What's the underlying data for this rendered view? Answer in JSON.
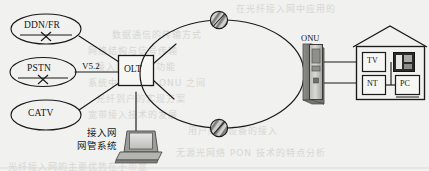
{
  "figure": {
    "type": "network-topology-diagram"
  },
  "background_color": "#f1f1ef",
  "line_color": "#1a1a1a",
  "sources": [
    {
      "id": "ddn-fr",
      "label": "DDN/FR",
      "shape": "ellipse",
      "has_cross_symbol": true
    },
    {
      "id": "pstn",
      "label": "PSTN",
      "shape": "ellipse",
      "has_cross_symbol": true
    },
    {
      "id": "catv",
      "label": "CATV",
      "shape": "ellipse",
      "has_cross_symbol": false
    }
  ],
  "interfaces": {
    "v52": "V5.2"
  },
  "nodes": {
    "olt": {
      "label": "OLT",
      "shape": "rectangle"
    },
    "onu": {
      "label": "ONU",
      "shape": "tower"
    }
  },
  "ring": {
    "shape": "ellipse",
    "node_symbols": [
      {
        "id": "ring-node-top",
        "name": "optical-node-icon"
      },
      {
        "id": "ring-node-bottom",
        "name": "optical-node-icon"
      }
    ]
  },
  "management": {
    "line1": "接入网",
    "line2": "网管系统",
    "device": "laptop"
  },
  "premises": {
    "shape": "house",
    "equipment": [
      {
        "id": "tv",
        "label": "TV"
      },
      {
        "id": "nt",
        "label": "NT"
      },
      {
        "id": "pc",
        "label": "PC"
      },
      {
        "id": "telephone",
        "label": "",
        "icon": "telephone-icon"
      }
    ]
  },
  "bleed_through": [
    {
      "text": "在光纤接入网中应用的",
      "x": 236,
      "y": 2
    },
    {
      "text": "数据通信的传输方式",
      "x": 112,
      "y": 28
    },
    {
      "text": "网络结构与信号传输",
      "x": 88,
      "y": 44
    },
    {
      "text": "接入网的基本功能",
      "x": 96,
      "y": 60
    },
    {
      "text": "系统中 OLT 与 ONU 之间",
      "x": 88,
      "y": 76
    },
    {
      "text": "光纤到户的实现方案",
      "x": 96,
      "y": 92
    },
    {
      "text": "宽带接入技术的发展",
      "x": 88,
      "y": 108
    },
    {
      "text": "用户终端设备的接入",
      "x": 188,
      "y": 124
    },
    {
      "text": "无源光网络 PON 技术的特点分析",
      "x": 176,
      "y": 146
    },
    {
      "text": "光纤接入网的主要优势在于带宽",
      "x": 8,
      "y": 160
    }
  ]
}
